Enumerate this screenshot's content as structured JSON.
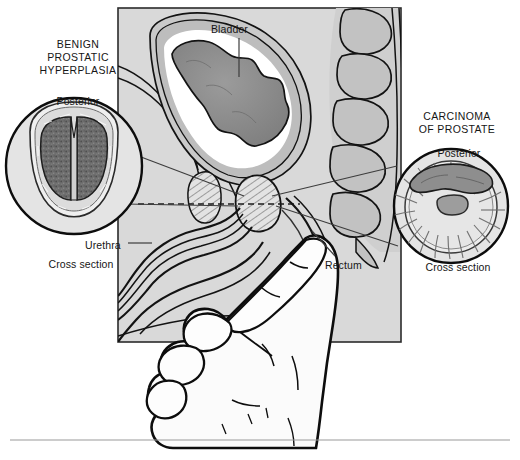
{
  "figure": {
    "type": "medical-illustration",
    "palette": {
      "background": "#ffffff",
      "panel_fill": "#d9d9d9",
      "tissue_light": "#e8e8e8",
      "tissue_mid": "#b9b9b9",
      "tissue_dark": "#8e8e8e",
      "bladder_interior": "#8a8a8a",
      "ink": "#111111",
      "leader_line": "#4a4a4a",
      "rule": "#9a9a9a"
    }
  },
  "insets": {
    "left": {
      "heading": "BENIGN\nPROSTATIC\nHYPERPLASIA",
      "heading_lines": [
        "BENIGN",
        "PROSTATIC",
        "HYPERPLASIA"
      ],
      "orientation_label": "Posterior",
      "caption": "Cross section",
      "description": "Symmetrically enlarged prostate with two bulky dark lobes separated by a deep median groove"
    },
    "right": {
      "heading": "CARCINOMA\nOF PROSTATE",
      "heading_lines": [
        "CARCINOMA",
        "OF PROSTATE"
      ],
      "orientation_label": "Posterior",
      "caption": "Cross section",
      "description": "Irregular dark tumour mass in the posterior lobe; radiating glandular striations around central urethra"
    }
  },
  "labels": {
    "bladder": "Bladder",
    "urethra": "Urethra",
    "rectum": "Rectum"
  },
  "structures": [
    "bladder",
    "bladder lining folds",
    "prostate",
    "pubic bone",
    "urethra",
    "penis",
    "rectum",
    "sacrum and vertebrae",
    "examining hand with extended index finger"
  ]
}
